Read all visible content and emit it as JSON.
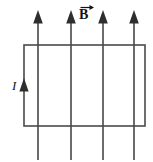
{
  "figure": {
    "background_color": "#ffffff",
    "line_color": "#3b3b3b",
    "loop_color": "#4a4a4a",
    "label_color": "#131313",
    "labels": {
      "magnetic_field": "B",
      "magnetic_field_accent": "vector-arrow-right",
      "current": "I"
    },
    "loop": {
      "shape": "rectangle",
      "x": 24,
      "y": 45,
      "width": 121,
      "height": 81,
      "stroke_width": 1.6
    },
    "field_lines": [
      {
        "x": 38,
        "y_top": 11,
        "y_bottom": 160,
        "arrow": "up"
      },
      {
        "x": 71,
        "y_top": 11,
        "y_bottom": 160,
        "arrow": "up"
      },
      {
        "x": 103,
        "y_top": 11,
        "y_bottom": 160,
        "arrow": "up"
      },
      {
        "x": 134,
        "y_top": 11,
        "y_bottom": 160,
        "arrow": "up"
      }
    ],
    "current_arrow": {
      "x": 24,
      "y": 86,
      "direction": "up"
    }
  }
}
